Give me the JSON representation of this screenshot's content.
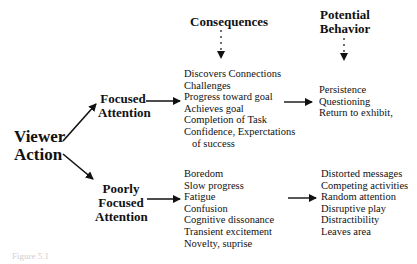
{
  "headers": {
    "consequences": "Consequences",
    "potential_behavior_line1": "Potential",
    "potential_behavior_line2": "Behavior"
  },
  "root": {
    "line1": "Viewer",
    "line2": "Action"
  },
  "branches": [
    {
      "label_line1": "Focused",
      "label_line2": "Attention",
      "consequences": [
        "Discovers Connections",
        "Challenges",
        "Progress toward goal",
        "Achieves goal",
        "Completion of Task",
        "Confidence, Experctations",
        "of success"
      ],
      "behaviors": [
        "Persistence",
        "Questioning",
        "Return to exhibit,"
      ]
    },
    {
      "label_line1": "Poorly",
      "label_line2": "Focused",
      "label_line3": "Attention",
      "consequences": [
        "Boredom",
        "Slow progress",
        "Fatigue",
        "Confusion",
        "Cognitive dissonance",
        "Transient excitement",
        "Novelty, suprise"
      ],
      "behaviors": [
        "Distorted messages",
        "Competing activities",
        "Random attention",
        "Disruptive play",
        "Distractibility",
        "Leaves area"
      ]
    }
  ],
  "caption": "Figure 5.1"
}
